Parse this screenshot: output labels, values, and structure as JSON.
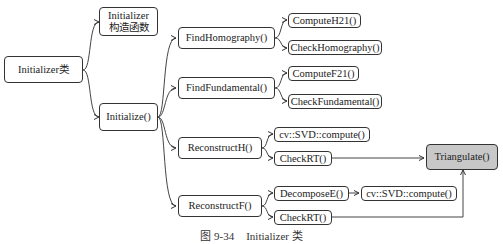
{
  "diagram": {
    "nodes": {
      "root": {
        "label": "Initializer类"
      },
      "ctor": {
        "line1": "Initializer",
        "line2": "构造函数"
      },
      "initialize": {
        "label": "Initialize()"
      },
      "find_homography": {
        "label": "FindHomography()"
      },
      "find_fundamental": {
        "label": "FindFundamental()"
      },
      "reconstruct_h": {
        "label": "ReconstructH()"
      },
      "reconstruct_f": {
        "label": "ReconstructF()"
      },
      "compute_h21": {
        "label": "ComputeH21()"
      },
      "check_homography": {
        "label": "CheckHomography()"
      },
      "compute_f21": {
        "label": "ComputeF21()"
      },
      "check_fundamental": {
        "label": "CheckFundamental()"
      },
      "svd_compute_h": {
        "label": "cv::SVD::compute()"
      },
      "check_rt_h": {
        "label": "CheckRT()"
      },
      "decompose_e": {
        "label": "DecomposeE()"
      },
      "svd_compute_f": {
        "label": "cv::SVD::compute()"
      },
      "check_rt_f": {
        "label": "CheckRT()"
      },
      "triangulate": {
        "label": "Triangulate()"
      }
    },
    "edges": [
      [
        "root",
        "ctor"
      ],
      [
        "root",
        "initialize"
      ],
      [
        "initialize",
        "find_homography"
      ],
      [
        "initialize",
        "find_fundamental"
      ],
      [
        "initialize",
        "reconstruct_h"
      ],
      [
        "initialize",
        "reconstruct_f"
      ],
      [
        "find_homography",
        "compute_h21"
      ],
      [
        "find_homography",
        "check_homography"
      ],
      [
        "find_fundamental",
        "compute_f21"
      ],
      [
        "find_fundamental",
        "check_fundamental"
      ],
      [
        "reconstruct_h",
        "svd_compute_h"
      ],
      [
        "reconstruct_h",
        "check_rt_h"
      ],
      [
        "reconstruct_f",
        "decompose_e"
      ],
      [
        "reconstruct_f",
        "check_rt_f"
      ],
      [
        "decompose_e",
        "svd_compute_f"
      ],
      [
        "check_rt_h",
        "triangulate"
      ],
      [
        "check_rt_f",
        "triangulate"
      ]
    ]
  },
  "caption": {
    "figure_no": "图 9-34",
    "title": "Initializer 类"
  }
}
